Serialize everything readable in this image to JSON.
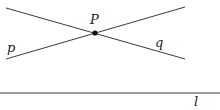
{
  "diagram": {
    "point": {
      "label": "P",
      "x": 95,
      "y": 33
    },
    "lines": [
      {
        "id": "p",
        "label": "p",
        "x1": 6,
        "y1": 59,
        "x2": 185,
        "y2": 7,
        "label_x": 7,
        "label_y": 53
      },
      {
        "id": "q",
        "label": "q",
        "x1": 6,
        "y1": 8,
        "x2": 185,
        "y2": 59,
        "label_x": 155,
        "label_y": 47
      },
      {
        "id": "l",
        "label": "l",
        "x1": 0,
        "y1": 93,
        "x2": 220,
        "y2": 93,
        "label_x": 194,
        "label_y": 106
      }
    ],
    "colors": {
      "stroke": "#3a3a3a",
      "point": "#111111",
      "text": "#222222"
    }
  }
}
